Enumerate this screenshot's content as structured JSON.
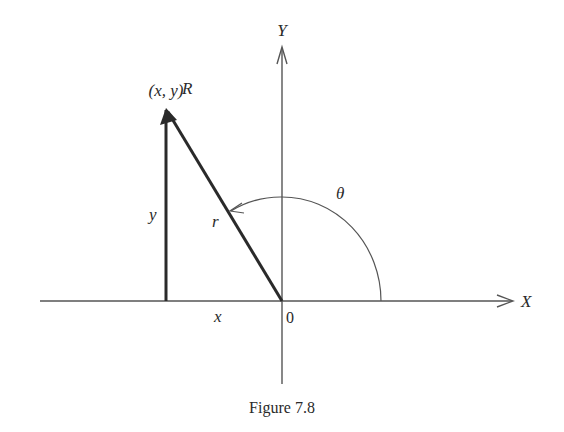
{
  "figure": {
    "caption": "Figure 7.8",
    "labels": {
      "y_axis": "Y",
      "x_axis": "X",
      "point": "(x, y)",
      "vector": "R",
      "radius": "r",
      "angle": "θ",
      "vertical_leg": "y",
      "horizontal_leg": "x",
      "origin": "0"
    },
    "colors": {
      "axis": "#555555",
      "vector": "#2a2a2a",
      "text": "#2a2a2a",
      "background": "#ffffff"
    }
  }
}
